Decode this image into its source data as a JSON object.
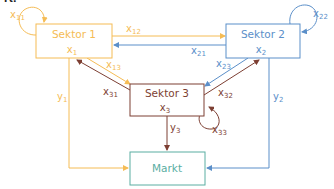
{
  "clipped_header_text": "rt:",
  "colors": {
    "sektor1": "#f5bc55",
    "sektor2": "#5b8fc9",
    "sektor3": "#7d3f33",
    "markt": "#5aaea2"
  },
  "nodes": {
    "sektor1": {
      "title": "Sektor 1",
      "var": "x",
      "var_sub": "1"
    },
    "sektor2": {
      "title": "Sektor 2",
      "var": "x",
      "var_sub": "2"
    },
    "sektor3": {
      "title": "Sektor 3",
      "var": "x",
      "var_sub": "3"
    },
    "markt": {
      "title": "Markt"
    }
  },
  "edges": {
    "x11": {
      "base": "x",
      "sub": "11",
      "from": "Sektor 1",
      "to": "Sektor 1"
    },
    "x22": {
      "base": "x",
      "sub": "22",
      "from": "Sektor 2",
      "to": "Sektor 2"
    },
    "x33": {
      "base": "x",
      "sub": "33",
      "from": "Sektor 3",
      "to": "Sektor 3"
    },
    "x12": {
      "base": "x",
      "sub": "12",
      "from": "Sektor 1",
      "to": "Sektor 2"
    },
    "x21": {
      "base": "x",
      "sub": "21",
      "from": "Sektor 2",
      "to": "Sektor 1"
    },
    "x13": {
      "base": "x",
      "sub": "13",
      "from": "Sektor 1",
      "to": "Sektor 3"
    },
    "x31": {
      "base": "x",
      "sub": "31",
      "from": "Sektor 3",
      "to": "Sektor 1"
    },
    "x23": {
      "base": "x",
      "sub": "23",
      "from": "Sektor 2",
      "to": "Sektor 3"
    },
    "x32": {
      "base": "x",
      "sub": "32",
      "from": "Sektor 3",
      "to": "Sektor 2"
    },
    "y1": {
      "base": "y",
      "sub": "1",
      "from": "Sektor 1",
      "to": "Markt"
    },
    "y2": {
      "base": "y",
      "sub": "2",
      "from": "Sektor 2",
      "to": "Markt"
    },
    "y3": {
      "base": "y",
      "sub": "3",
      "from": "Sektor 3",
      "to": "Markt"
    }
  }
}
